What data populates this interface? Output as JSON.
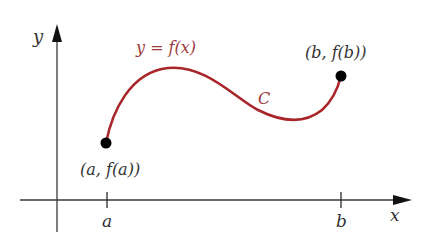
{
  "figure": {
    "axes": {
      "x_label": "x",
      "y_label": "y",
      "color": "#2b2b2b"
    },
    "curve": {
      "equation_label": "y = f(x)",
      "name_label": "C",
      "color": "#a8252a"
    },
    "points": [
      {
        "id": "a",
        "label": "(a, f(a))",
        "tick_label": "a"
      },
      {
        "id": "b",
        "label": "(b, f(b))",
        "tick_label": "b"
      }
    ]
  }
}
